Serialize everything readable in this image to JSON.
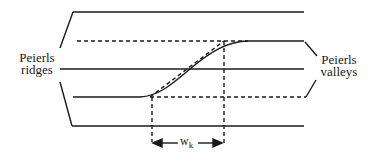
{
  "diagram": {
    "type": "kink-in-Peierls-potential",
    "labels": {
      "left": {
        "line1": "Peierls",
        "line2": "ridges"
      },
      "right": {
        "line1": "Peierls",
        "line2": "valleys"
      },
      "width": {
        "main": "w",
        "sub": "k"
      }
    },
    "colors": {
      "line": "#1a1a1a",
      "background": "#ffffff"
    }
  }
}
